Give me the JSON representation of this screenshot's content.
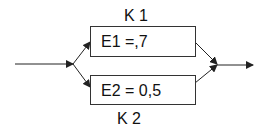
{
  "diagram": {
    "type": "parallel-system",
    "components": [
      {
        "id": "K1",
        "label": "K 1",
        "value_text": "E1 =,7"
      },
      {
        "id": "K2",
        "label": "K 2",
        "value_text": "E2 = 0,5"
      }
    ],
    "colors": {
      "line": "#222222",
      "box_border": "#333333",
      "text": "#111111",
      "background": "#ffffff"
    }
  }
}
